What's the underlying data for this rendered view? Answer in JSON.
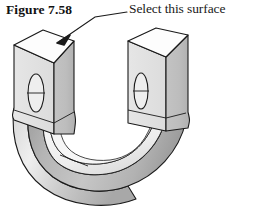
{
  "figure": {
    "label": "Figure 7.58",
    "callout_text": "Select this surface",
    "background_color": "#ffffff",
    "ink_color": "#1a1a1a"
  },
  "annotation": {
    "leader_line_name": "leader-line",
    "arrow_target": "top face of left vertical prism",
    "arrow_tip_x": 57,
    "arrow_tip_y": 43
  },
  "solid": {
    "name": "u-shaped-bracket",
    "description": "U-shaped bent solid bar shown in isometric view with two upright legs joined by a semicircular bend",
    "face_colors": {
      "top_face": "#fdfdfd",
      "left_face": "#e2e2e2",
      "front_face": "#b9b9b9",
      "inner_face": "#f4f4f4",
      "bend_light": "#e8e8e8",
      "bend_dark": "#9e9e9e",
      "outline": "#1a1a1a"
    },
    "features": [
      {
        "name": "through-hole-left",
        "shape": "ellipse",
        "cx": 36,
        "cy": 93,
        "rx": 8,
        "ry": 19
      },
      {
        "name": "through-hole-right",
        "shape": "ellipse",
        "cx": 141,
        "cy": 91,
        "rx": 7,
        "ry": 18
      }
    ]
  }
}
